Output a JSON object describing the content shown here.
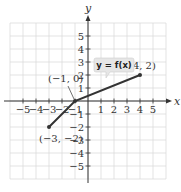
{
  "chart_data": {
    "type": "line",
    "title": "",
    "xlabel": "x",
    "ylabel": "y",
    "xlim": [
      -6,
      6
    ],
    "ylim": [
      -6,
      6
    ],
    "grid": true,
    "x_ticks": [
      -5,
      -4,
      -3,
      -2,
      -1,
      1,
      2,
      3,
      4,
      5
    ],
    "y_ticks": [
      -5,
      -4,
      -3,
      -2,
      -1,
      1,
      2,
      3,
      4,
      5
    ],
    "x_tick_labels": [
      "−5",
      "−4",
      "−3",
      "−2",
      "−1",
      "1",
      "2",
      "3",
      "4",
      "5"
    ],
    "y_tick_labels": [
      "−5",
      "−4",
      "−3",
      "−2",
      "−1",
      "1",
      "2",
      "3",
      "4",
      "5"
    ],
    "series": [
      {
        "name": "y = f(x)",
        "points": [
          [
            -3,
            -2
          ],
          [
            -1,
            0
          ],
          [
            4,
            2
          ]
        ],
        "color": "#333333"
      }
    ],
    "annotations": [
      {
        "text": "(−3, −2)",
        "x": -3,
        "y": -2
      },
      {
        "text": "(−1, 0)",
        "x": -1,
        "y": 0
      },
      {
        "text": "(4, 2)",
        "x": 4,
        "y": 2
      },
      {
        "text": "y = f(x)",
        "type": "callout"
      }
    ]
  },
  "colors": {
    "grid": "#dcdcdc",
    "axis": "#333333",
    "line": "#333333",
    "callout_bg": "#e6e6e6"
  }
}
